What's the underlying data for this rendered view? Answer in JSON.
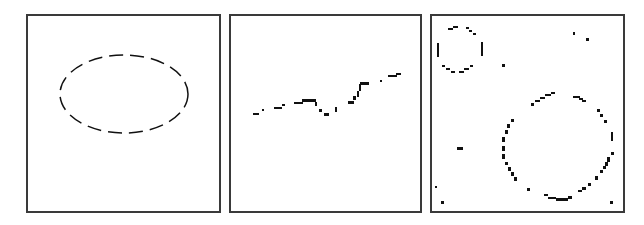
{
  "figure": {
    "background": "#ffffff",
    "border_color": "#3a3a3a",
    "ink_color": "#111111",
    "panels": [
      {
        "id": "panel-a",
        "content": "dashed ellipse",
        "box": {
          "x": 26,
          "y": 14,
          "w": 195,
          "h": 199
        },
        "ellipse": {
          "cx": 96,
          "cy": 78,
          "rx": 64,
          "ry": 39,
          "dash": "14 7"
        }
      },
      {
        "id": "panel-b",
        "content": "noisy pixelated curve",
        "box": {
          "x": 229,
          "y": 14,
          "w": 193,
          "h": 199
        },
        "segments": [
          [
            22,
            97,
            6,
            2
          ],
          [
            31,
            93,
            2,
            2
          ],
          [
            43,
            91,
            8,
            2
          ],
          [
            51,
            88,
            3,
            2
          ],
          [
            63,
            86,
            9,
            2
          ],
          [
            71,
            83,
            14,
            3
          ],
          [
            84,
            86,
            2,
            4
          ],
          [
            88,
            93,
            3,
            3
          ],
          [
            93,
            97,
            5,
            3
          ],
          [
            104,
            91,
            2,
            5
          ],
          [
            117,
            85,
            6,
            3
          ],
          [
            122,
            80,
            3,
            4
          ],
          [
            126,
            75,
            2,
            6
          ],
          [
            128,
            68,
            2,
            7
          ],
          [
            129,
            66,
            9,
            3
          ],
          [
            149,
            64,
            2,
            2
          ],
          [
            157,
            59,
            9,
            2
          ],
          [
            165,
            57,
            5,
            2
          ]
        ]
      },
      {
        "id": "panel-c",
        "content": "pixelated circles with noise",
        "box": {
          "x": 430,
          "y": 14,
          "w": 195,
          "h": 199
        },
        "segments": [
          [
            16,
            12,
            5,
            2
          ],
          [
            21,
            10,
            5,
            2
          ],
          [
            34,
            11,
            3,
            2
          ],
          [
            37,
            14,
            3,
            2
          ],
          [
            41,
            17,
            3,
            2
          ],
          [
            5,
            27,
            2,
            14
          ],
          [
            49,
            26,
            2,
            14
          ],
          [
            10,
            49,
            3,
            2
          ],
          [
            14,
            52,
            4,
            2
          ],
          [
            19,
            55,
            4,
            2
          ],
          [
            27,
            55,
            5,
            2
          ],
          [
            32,
            52,
            5,
            2
          ],
          [
            38,
            49,
            3,
            2
          ],
          [
            70,
            48,
            3,
            3
          ],
          [
            141,
            16,
            2,
            3
          ],
          [
            154,
            22,
            3,
            3
          ],
          [
            25,
            131,
            6,
            3
          ],
          [
            3,
            170,
            2,
            2
          ],
          [
            9,
            185,
            3,
            3
          ],
          [
            178,
            185,
            3,
            3
          ],
          [
            99,
            87,
            3,
            3
          ],
          [
            103,
            84,
            5,
            2
          ],
          [
            108,
            81,
            5,
            2
          ],
          [
            113,
            78,
            6,
            2
          ],
          [
            119,
            76,
            4,
            2
          ],
          [
            141,
            80,
            7,
            2
          ],
          [
            147,
            82,
            4,
            2
          ],
          [
            150,
            84,
            4,
            2
          ],
          [
            165,
            93,
            3,
            3
          ],
          [
            168,
            98,
            3,
            3
          ],
          [
            172,
            104,
            3,
            3
          ],
          [
            179,
            116,
            2,
            9
          ],
          [
            179,
            136,
            3,
            3
          ],
          [
            175,
            141,
            3,
            5
          ],
          [
            173,
            146,
            3,
            4
          ],
          [
            171,
            150,
            3,
            3
          ],
          [
            168,
            154,
            3,
            3
          ],
          [
            163,
            160,
            3,
            4
          ],
          [
            156,
            167,
            3,
            3
          ],
          [
            150,
            171,
            4,
            3
          ],
          [
            146,
            174,
            4,
            2
          ],
          [
            136,
            180,
            4,
            3
          ],
          [
            124,
            182,
            12,
            3
          ],
          [
            116,
            181,
            8,
            2
          ],
          [
            112,
            178,
            4,
            2
          ],
          [
            95,
            172,
            3,
            3
          ],
          [
            82,
            161,
            3,
            4
          ],
          [
            79,
            156,
            3,
            4
          ],
          [
            76,
            151,
            3,
            4
          ],
          [
            73,
            146,
            3,
            3
          ],
          [
            70,
            138,
            3,
            5
          ],
          [
            70,
            130,
            3,
            5
          ],
          [
            70,
            121,
            3,
            5
          ],
          [
            73,
            114,
            3,
            4
          ],
          [
            75,
            108,
            3,
            4
          ],
          [
            79,
            103,
            3,
            3
          ]
        ]
      }
    ]
  }
}
